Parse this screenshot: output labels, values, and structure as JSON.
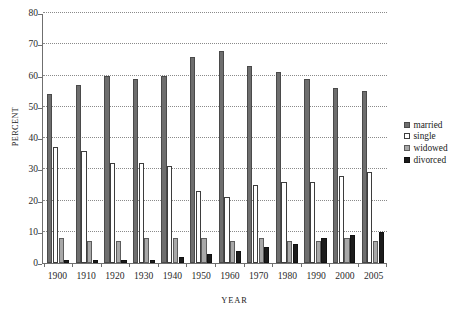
{
  "chart_data": {
    "type": "bar",
    "title": "",
    "xlabel": "YEAR",
    "ylabel": "PERCENT",
    "ylim": [
      0,
      80
    ],
    "ytick_step": 10,
    "yticks": [
      0,
      10,
      20,
      30,
      40,
      50,
      60,
      70,
      80
    ],
    "grid": true,
    "legend_position": "right",
    "categories": [
      "1900",
      "1910",
      "1920",
      "1930",
      "1940",
      "1950",
      "1960",
      "1970",
      "1980",
      "1990",
      "2000",
      "2005"
    ],
    "series": [
      {
        "name": "married",
        "color": "#6e6e6e",
        "values": [
          54,
          57,
          60,
          59,
          60,
          66,
          68,
          63,
          61,
          59,
          56,
          55
        ]
      },
      {
        "name": "single",
        "color": "#ffffff",
        "values": [
          37,
          36,
          32,
          32,
          31,
          23,
          21,
          25,
          26,
          26,
          28,
          29
        ]
      },
      {
        "name": "widowed",
        "color": "#a8a8a8",
        "values": [
          8,
          7,
          7,
          8,
          8,
          8,
          7,
          8,
          7,
          7,
          8,
          7
        ]
      },
      {
        "name": "divorced",
        "color": "#1c1c1c",
        "values": [
          1,
          1,
          1,
          1,
          2,
          3,
          4,
          5,
          6,
          8,
          9,
          10
        ]
      }
    ]
  }
}
